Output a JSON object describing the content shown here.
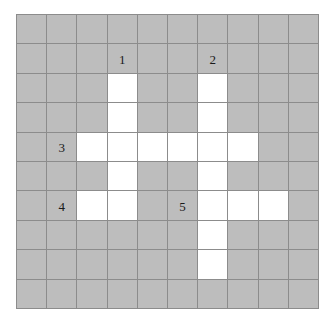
{
  "puzzle": {
    "type": "crossword-grid",
    "rows": 10,
    "columns": 10,
    "colors": {
      "block_fill": "#bdbdbd",
      "open_fill": "#ffffff",
      "grid_line": "#8c8c8c",
      "number_text": "#1a1a1a",
      "page_background": "#ffffff"
    },
    "cells": [
      [
        {
          "state": "block",
          "number": ""
        },
        {
          "state": "block",
          "number": ""
        },
        {
          "state": "block",
          "number": ""
        },
        {
          "state": "block",
          "number": ""
        },
        {
          "state": "block",
          "number": ""
        },
        {
          "state": "block",
          "number": ""
        },
        {
          "state": "block",
          "number": ""
        },
        {
          "state": "block",
          "number": ""
        },
        {
          "state": "block",
          "number": ""
        },
        {
          "state": "block",
          "number": ""
        }
      ],
      [
        {
          "state": "block",
          "number": ""
        },
        {
          "state": "block",
          "number": ""
        },
        {
          "state": "block",
          "number": ""
        },
        {
          "state": "block",
          "number": "1"
        },
        {
          "state": "block",
          "number": ""
        },
        {
          "state": "block",
          "number": ""
        },
        {
          "state": "block",
          "number": "2"
        },
        {
          "state": "block",
          "number": ""
        },
        {
          "state": "block",
          "number": ""
        },
        {
          "state": "block",
          "number": ""
        }
      ],
      [
        {
          "state": "block",
          "number": ""
        },
        {
          "state": "block",
          "number": ""
        },
        {
          "state": "block",
          "number": ""
        },
        {
          "state": "open",
          "number": ""
        },
        {
          "state": "block",
          "number": ""
        },
        {
          "state": "block",
          "number": ""
        },
        {
          "state": "open",
          "number": ""
        },
        {
          "state": "block",
          "number": ""
        },
        {
          "state": "block",
          "number": ""
        },
        {
          "state": "block",
          "number": ""
        }
      ],
      [
        {
          "state": "block",
          "number": ""
        },
        {
          "state": "block",
          "number": ""
        },
        {
          "state": "block",
          "number": ""
        },
        {
          "state": "open",
          "number": ""
        },
        {
          "state": "block",
          "number": ""
        },
        {
          "state": "block",
          "number": ""
        },
        {
          "state": "open",
          "number": ""
        },
        {
          "state": "block",
          "number": ""
        },
        {
          "state": "block",
          "number": ""
        },
        {
          "state": "block",
          "number": ""
        }
      ],
      [
        {
          "state": "block",
          "number": ""
        },
        {
          "state": "block",
          "number": "3"
        },
        {
          "state": "open",
          "number": ""
        },
        {
          "state": "open",
          "number": ""
        },
        {
          "state": "open",
          "number": ""
        },
        {
          "state": "open",
          "number": ""
        },
        {
          "state": "open",
          "number": ""
        },
        {
          "state": "open",
          "number": ""
        },
        {
          "state": "block",
          "number": ""
        },
        {
          "state": "block",
          "number": ""
        }
      ],
      [
        {
          "state": "block",
          "number": ""
        },
        {
          "state": "block",
          "number": ""
        },
        {
          "state": "block",
          "number": ""
        },
        {
          "state": "open",
          "number": ""
        },
        {
          "state": "block",
          "number": ""
        },
        {
          "state": "block",
          "number": ""
        },
        {
          "state": "open",
          "number": ""
        },
        {
          "state": "block",
          "number": ""
        },
        {
          "state": "block",
          "number": ""
        },
        {
          "state": "block",
          "number": ""
        }
      ],
      [
        {
          "state": "block",
          "number": ""
        },
        {
          "state": "block",
          "number": "4"
        },
        {
          "state": "open",
          "number": ""
        },
        {
          "state": "open",
          "number": ""
        },
        {
          "state": "block",
          "number": ""
        },
        {
          "state": "block",
          "number": "5"
        },
        {
          "state": "open",
          "number": ""
        },
        {
          "state": "open",
          "number": ""
        },
        {
          "state": "open",
          "number": ""
        },
        {
          "state": "block",
          "number": ""
        }
      ],
      [
        {
          "state": "block",
          "number": ""
        },
        {
          "state": "block",
          "number": ""
        },
        {
          "state": "block",
          "number": ""
        },
        {
          "state": "block",
          "number": ""
        },
        {
          "state": "block",
          "number": ""
        },
        {
          "state": "block",
          "number": ""
        },
        {
          "state": "open",
          "number": ""
        },
        {
          "state": "block",
          "number": ""
        },
        {
          "state": "block",
          "number": ""
        },
        {
          "state": "block",
          "number": ""
        }
      ],
      [
        {
          "state": "block",
          "number": ""
        },
        {
          "state": "block",
          "number": ""
        },
        {
          "state": "block",
          "number": ""
        },
        {
          "state": "block",
          "number": ""
        },
        {
          "state": "block",
          "number": ""
        },
        {
          "state": "block",
          "number": ""
        },
        {
          "state": "open",
          "number": ""
        },
        {
          "state": "block",
          "number": ""
        },
        {
          "state": "block",
          "number": ""
        },
        {
          "state": "block",
          "number": ""
        }
      ],
      [
        {
          "state": "block",
          "number": ""
        },
        {
          "state": "block",
          "number": ""
        },
        {
          "state": "block",
          "number": ""
        },
        {
          "state": "block",
          "number": ""
        },
        {
          "state": "block",
          "number": ""
        },
        {
          "state": "block",
          "number": ""
        },
        {
          "state": "block",
          "number": ""
        },
        {
          "state": "block",
          "number": ""
        },
        {
          "state": "block",
          "number": ""
        },
        {
          "state": "block",
          "number": ""
        }
      ]
    ]
  }
}
